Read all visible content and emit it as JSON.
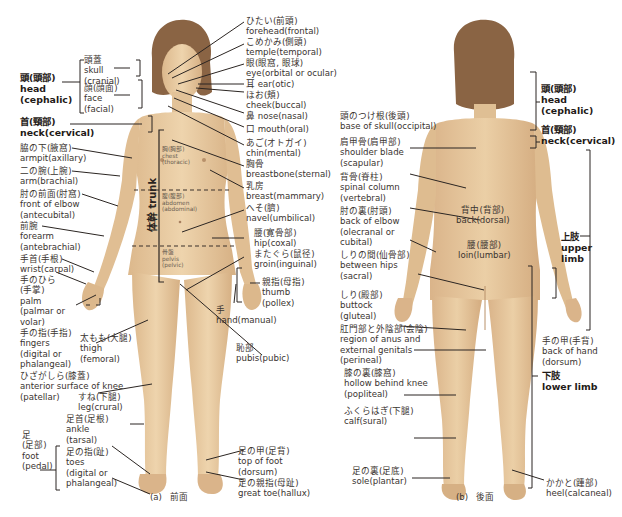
{
  "figure": {
    "panels": [
      {
        "id": "a",
        "caption_letter": "(a)",
        "caption_view": "前面"
      },
      {
        "id": "b",
        "caption_letter": "(b)",
        "caption_view": "後面"
      }
    ]
  },
  "front": {
    "left_labels": {
      "head": {
        "jp": "頭(頭部)",
        "en": "head",
        "en2": "(cephalic)"
      },
      "skull": {
        "jp": "頭蓋",
        "en": "skull",
        "en2": "(cranial)"
      },
      "face": {
        "jp": "顔(顔面)",
        "en": "face",
        "en2": "(facial)"
      },
      "neck": {
        "jp": "首(頸部)",
        "en": "neck(cervical)"
      },
      "armpit": {
        "jp": "脇の下(腋窩)",
        "en": "armpit(axillary)"
      },
      "arm": {
        "jp": "二の腕(上腕)",
        "en": "arm(brachial)"
      },
      "elbow_front": {
        "jp": "肘の前面(肘窩)",
        "en": "front of elbow",
        "en2": "(antecubital)"
      },
      "forearm": {
        "jp": "前腕",
        "en": "forearm",
        "en2": "(antebrachial)"
      },
      "wrist": {
        "jp": "手首(手根)",
        "en": "wrist(carpal)"
      },
      "palm": {
        "jp": "手のひら",
        "jp2": "(手掌)",
        "en": "palm",
        "en2": "(palmar or",
        "en3": "volar)"
      },
      "fingers": {
        "jp": "手の指(手指)",
        "en": "fingers",
        "en2": "(digital or",
        "en3": "phalangeal)"
      },
      "thigh": {
        "jp": "太もも(大腿)",
        "en": "thigh",
        "en2": "(femoral)"
      },
      "knee_front": {
        "jp": "ひざがしら(膝蓋)",
        "en": "anterior surface of knee",
        "en2": "(patellar)"
      },
      "leg": {
        "jp": "すね(下腿)",
        "en": "leg(crural)"
      },
      "foot": {
        "jp": "足",
        "jp2": "(足部)",
        "en": "foot",
        "en2": "(pedal)"
      },
      "ankle": {
        "jp": "足首(足根)",
        "en": "ankle",
        "en2": "(tarsal)"
      },
      "toes": {
        "jp": "足の指(趾)",
        "en": "toes",
        "en2": "(digital or",
        "en3": "phalangeal)"
      }
    },
    "right_labels": {
      "forehead": {
        "jp": "ひたい(前頭)",
        "en": "forehead(frontal)"
      },
      "temple": {
        "jp": "こめかみ(側頭)",
        "en": "temple(temporal)"
      },
      "eye": {
        "jp": "眼(眼窩, 眼球)",
        "en": "eye(orbital or ocular)"
      },
      "ear": {
        "jp": "耳",
        "en": "ear(otic)"
      },
      "cheek": {
        "jp": "ほお(頬)",
        "en": "cheek(buccal)"
      },
      "nose": {
        "jp": "鼻",
        "en": "nose(nasal)"
      },
      "mouth": {
        "jp": "口",
        "en": "mouth(oral)"
      },
      "chin": {
        "jp": "あご(オトガイ)",
        "en": "chin(mental)"
      },
      "breastbone": {
        "jp": "胸骨",
        "en": "breastbone(sternal)"
      },
      "breast": {
        "jp": "乳房",
        "en": "breast(mammary)"
      },
      "navel": {
        "jp": "へそ(臍)",
        "en": "navel(umbilical)"
      },
      "hip": {
        "jp": "腰(寛骨部)",
        "en": "hip(coxal)"
      },
      "groin": {
        "jp": "またぐら(鼠径)",
        "en": "groin(inguinal)"
      },
      "thumb": {
        "jp": "親指(母指)",
        "en": "thumb",
        "en2": "(pollex)"
      },
      "hand": {
        "jp": "手",
        "en": "hand(manual)"
      },
      "pubis": {
        "jp": "恥部",
        "en": "pubis(pubic)"
      },
      "top_of_foot": {
        "jp": "足の甲(足背)",
        "en": "top of foot",
        "en2": "(dorsum)"
      },
      "great_toe": {
        "jp": "足の親指(母趾)",
        "en": "great toe(hallux)"
      }
    },
    "trunk_regions": {
      "trunk_jp": "体幹",
      "trunk_en": "trunk",
      "chest": {
        "jp": "胸(胸部)",
        "en": "chest",
        "en2": "(thoracic)"
      },
      "abdomen": {
        "jp": "腹(腹部)",
        "en": "abdomen",
        "en2": "(abdominal)"
      },
      "pelvis": {
        "jp": "骨盤",
        "en": "pelvis",
        "en2": "(pelvic)"
      }
    }
  },
  "back": {
    "left_labels": {
      "base_of_skull": {
        "jp": "頭のつけ根(後頭)",
        "en": "base of skull(occipital)"
      },
      "shoulder_blade": {
        "jp": "肩甲骨(肩甲部)",
        "en": "shoulder blade",
        "en2": "(scapular)"
      },
      "spinal_column": {
        "jp": "背骨(脊柱)",
        "en": "spinal column",
        "en2": "(vertebral)"
      },
      "back_of_elbow": {
        "jp": "肘の裏(肘頭)",
        "en": "back of elbow",
        "en2": "(olecranal or",
        "en3": "cubital)"
      },
      "between_hips": {
        "jp": "しりの間(仙骨部)",
        "en": "between hips",
        "en2": "(sacral)"
      },
      "buttock": {
        "jp": "しり(殿部)",
        "en": "buttock",
        "en2": "(gluteal)"
      },
      "perineal": {
        "jp": "肛門部と外陰部(会陰)",
        "en": "region of anus and",
        "en2": "external genitals",
        "en3": "(perineal)"
      },
      "hollow_knee": {
        "jp": "膝の裏(膝窩)",
        "en": "hollow behind knee",
        "en2": "(popliteal)"
      },
      "calf": {
        "jp": "ふくらはぎ(下腿)",
        "en": "calf(sural)"
      },
      "sole": {
        "jp": "足の裏(足底)",
        "en": "sole(plantar)"
      }
    },
    "body_labels": {
      "back": {
        "jp": "背中(背部)",
        "en": "back(dorsal)"
      },
      "loin": {
        "jp": "腰(腰部)",
        "en": "loin(lumbar)"
      }
    },
    "right_labels": {
      "head": {
        "jp": "頭(頭部)",
        "en": "head",
        "en2": "(cephalic)"
      },
      "neck": {
        "jp": "首(頸部)",
        "en": "neck(cervical)"
      },
      "upper_limb": {
        "jp": "上肢",
        "en": "upper",
        "en2": "limb"
      },
      "back_of_hand": {
        "jp": "手の甲(手背)",
        "en": "back of hand",
        "en2": "(dorsum)"
      },
      "lower_limb": {
        "jp": "下肢",
        "en": "lower limb"
      },
      "heel": {
        "jp": "かかと(踵部)",
        "en": "heel(calcaneal)"
      }
    }
  },
  "colors": {
    "skin": "#e8c9a0",
    "skin_shade": "#d9b288",
    "hair": "#8a6444",
    "line": "#2b2522",
    "text": "#3a3430",
    "background": "#ffffff"
  }
}
